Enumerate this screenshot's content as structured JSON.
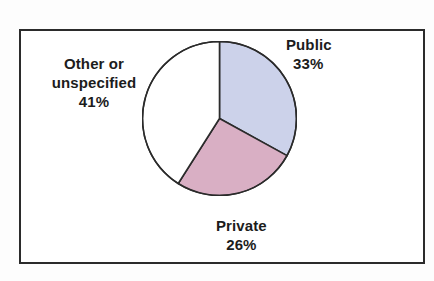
{
  "figure": {
    "background_color": "#fdfdfd",
    "frame_border_color": "#2b2b2b",
    "plot_background": "#ffffff"
  },
  "chart_data": {
    "type": "pie",
    "title": "",
    "xlabel": "",
    "ylabel": "",
    "grid": false,
    "legend_position": "none",
    "label_style": "outside-slice-callout-text",
    "start_angle_deg": 90,
    "direction": "clockwise",
    "categories": [
      "Public",
      "Private",
      "Other or unspecified"
    ],
    "values": [
      33,
      26,
      41
    ],
    "value_unit": "percent",
    "colors": [
      "#ccd2ea",
      "#d9afc4",
      "#ffffff"
    ],
    "slice_outline_color": "#2b2b2b",
    "slices": [
      {
        "name": "Public",
        "label": "Public",
        "value": 33,
        "value_text": "33%",
        "color": "#ccd2ea",
        "start_deg": 0,
        "end_deg": 118.8
      },
      {
        "name": "Private",
        "label": "Private",
        "value": 26,
        "value_text": "26%",
        "color": "#d9afc4",
        "start_deg": 118.8,
        "end_deg": 212.4
      },
      {
        "name": "Other or unspecified",
        "label_line1": "Other or",
        "label_line2": "unspecified",
        "value": 41,
        "value_text": "41%",
        "color": "#ffffff",
        "start_deg": 212.4,
        "end_deg": 360
      }
    ]
  },
  "labels": {
    "public": {
      "name": "Public",
      "percent": "33%"
    },
    "private": {
      "name": "Private",
      "percent": "26%"
    },
    "other": {
      "line1": "Other or",
      "line2": "unspecified",
      "percent": "41%"
    }
  }
}
